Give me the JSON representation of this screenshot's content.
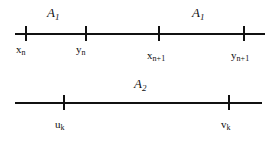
{
  "figure": {
    "ink_color": "#111111",
    "background_color": "#ffffff"
  },
  "lines": [
    {
      "id": "line-a1",
      "set_labels": [
        {
          "name": "A",
          "sub": "1"
        },
        {
          "name": "A",
          "sub": "1"
        }
      ],
      "points": [
        {
          "name": "x",
          "sub": "n"
        },
        {
          "name": "y",
          "sub": "n"
        },
        {
          "name": "x",
          "sub": "n+1"
        },
        {
          "name": "y",
          "sub": "n+1"
        }
      ]
    },
    {
      "id": "line-a2",
      "set_labels": [
        {
          "name": "A",
          "sub": "2"
        }
      ],
      "points": [
        {
          "name": "u",
          "sub": "k"
        },
        {
          "name": "v",
          "sub": "k"
        }
      ]
    }
  ]
}
